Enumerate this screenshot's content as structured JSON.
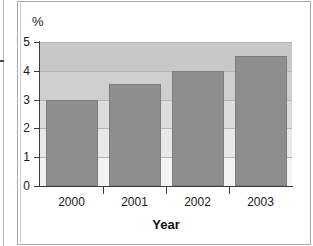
{
  "chart_data": {
    "type": "bar",
    "title": "",
    "categories": [
      "2000",
      "2001",
      "2002",
      "2003"
    ],
    "values": [
      3.0,
      3.55,
      4.0,
      4.5
    ],
    "xlabel": "Year",
    "ylabel": "%",
    "ylim": [
      0,
      5
    ],
    "yticks": [
      0,
      1,
      2,
      3,
      4,
      5
    ],
    "ytick_labels": [
      "0",
      "1",
      "2",
      "3",
      "4",
      "5"
    ],
    "grid": true,
    "grid_axis": "y",
    "legend": false,
    "bar_color": "#8e8e8e",
    "plot_bg_top_color": "#c8c8c8",
    "plot_bg_bottom_color": "#ffffff",
    "axis_color": "#3c3c3c",
    "gridline_color": "#b5b5b5",
    "frame_color": "#a9a9a9",
    "series": [
      {
        "name": "value",
        "values": [
          3.0,
          3.55,
          4.0,
          4.5
        ]
      }
    ]
  },
  "chart": {
    "unit_label": "%",
    "axis_title_x": "Year",
    "y_tick_labels": [
      "5",
      "4",
      "3",
      "2",
      "1",
      "0"
    ],
    "x_tick_labels": [
      "2000",
      "2001",
      "2002",
      "2003"
    ]
  }
}
